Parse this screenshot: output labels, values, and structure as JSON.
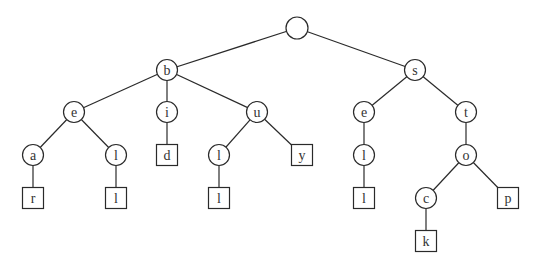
{
  "diagram": {
    "type": "trie",
    "words": [
      "bear",
      "bell",
      "bid",
      "bull",
      "buy",
      "sell",
      "stock",
      "stop"
    ],
    "colors": {
      "stroke": "#2a2a2a",
      "text": "#333333",
      "background": "#ffffff"
    },
    "nodes": [
      {
        "id": "root",
        "label": "",
        "shape": "circle",
        "x": 297,
        "y": 28
      },
      {
        "id": "b",
        "label": "b",
        "shape": "circle",
        "x": 167,
        "y": 70,
        "parent": "root"
      },
      {
        "id": "s",
        "label": "s",
        "shape": "circle",
        "x": 415,
        "y": 70,
        "parent": "root"
      },
      {
        "id": "be",
        "label": "e",
        "shape": "circle",
        "x": 74,
        "y": 112,
        "parent": "b"
      },
      {
        "id": "bi",
        "label": "i",
        "shape": "circle",
        "x": 167,
        "y": 112,
        "parent": "b"
      },
      {
        "id": "bu",
        "label": "u",
        "shape": "circle",
        "x": 257,
        "y": 112,
        "parent": "b"
      },
      {
        "id": "se",
        "label": "e",
        "shape": "circle",
        "x": 364,
        "y": 112,
        "parent": "s"
      },
      {
        "id": "st",
        "label": "t",
        "shape": "circle",
        "x": 466,
        "y": 112,
        "parent": "s"
      },
      {
        "id": "bea",
        "label": "a",
        "shape": "circle",
        "x": 33,
        "y": 155,
        "parent": "be"
      },
      {
        "id": "bel",
        "label": "l",
        "shape": "circle",
        "x": 116,
        "y": 155,
        "parent": "be"
      },
      {
        "id": "bid",
        "label": "d",
        "shape": "box",
        "x": 167,
        "y": 155,
        "parent": "bi"
      },
      {
        "id": "bul",
        "label": "l",
        "shape": "circle",
        "x": 219,
        "y": 155,
        "parent": "bu"
      },
      {
        "id": "buy",
        "label": "y",
        "shape": "box",
        "x": 302,
        "y": 155,
        "parent": "bu"
      },
      {
        "id": "sel",
        "label": "l",
        "shape": "circle",
        "x": 364,
        "y": 155,
        "parent": "se"
      },
      {
        "id": "sto",
        "label": "o",
        "shape": "circle",
        "x": 466,
        "y": 155,
        "parent": "st"
      },
      {
        "id": "bear",
        "label": "r",
        "shape": "box",
        "x": 33,
        "y": 198,
        "parent": "bea"
      },
      {
        "id": "bell",
        "label": "l",
        "shape": "box",
        "x": 116,
        "y": 198,
        "parent": "bel"
      },
      {
        "id": "bull",
        "label": "l",
        "shape": "box",
        "x": 219,
        "y": 198,
        "parent": "bul"
      },
      {
        "id": "sell",
        "label": "l",
        "shape": "box",
        "x": 364,
        "y": 198,
        "parent": "sel"
      },
      {
        "id": "stoc",
        "label": "c",
        "shape": "circle",
        "x": 426,
        "y": 198,
        "parent": "sto"
      },
      {
        "id": "stop",
        "label": "p",
        "shape": "box",
        "x": 508,
        "y": 198,
        "parent": "sto"
      },
      {
        "id": "stock",
        "label": "k",
        "shape": "box",
        "x": 426,
        "y": 241,
        "parent": "stoc"
      }
    ]
  }
}
